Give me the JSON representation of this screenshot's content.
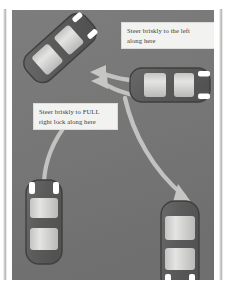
{
  "figure": {
    "background_color": "#767676",
    "arrow_color": "#c8c8c6",
    "car_body_color": "#5e5e5e",
    "car_glass_color": "#d6d6d4",
    "lamp_color": "#ffffff",
    "callout_bg": "#f2f2f0",
    "callout_text_color": "#3a3a3a"
  },
  "callouts": [
    {
      "id": "steer-left",
      "line1": "Steer briskly to the left",
      "line2": "along here"
    },
    {
      "id": "full-right-lock",
      "line1": "Steer briskly to FULL",
      "line2": "right lock along here"
    }
  ],
  "cars": [
    {
      "id": "car-top-left-angled",
      "label": "angled car, top left",
      "heading": "up-left"
    },
    {
      "id": "car-middle-right",
      "label": "horizontal car, middle right",
      "heading": "right"
    },
    {
      "id": "car-bottom-left",
      "label": "vertical car, bottom left",
      "heading": "up"
    },
    {
      "id": "car-bottom-right",
      "label": "vertical car, bottom right",
      "heading": "down"
    }
  ],
  "paths": [
    {
      "id": "path-steer-left",
      "label": "curved arrow to upper left",
      "arrow": "up-left"
    },
    {
      "id": "path-steer-left-secondary",
      "label": "second curved arrow to upper left",
      "arrow": "up-left"
    },
    {
      "id": "path-full-right-lock",
      "label": "curved arrow from bottom left car upward",
      "arrow": "none"
    },
    {
      "id": "path-sweep-right",
      "label": "long curved arrow sweeping to bottom right",
      "arrow": "down"
    }
  ]
}
